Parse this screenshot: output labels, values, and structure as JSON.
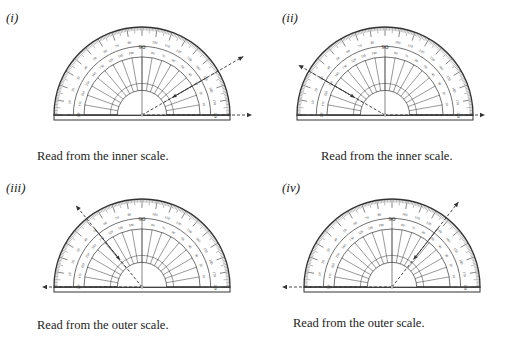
{
  "panels": [
    {
      "id": "i",
      "label": "(i)",
      "caption": "Read from the inner scale.",
      "label_pos": [
        6,
        10
      ],
      "caption_pos": [
        37,
        149
      ],
      "center": [
        142,
        115
      ],
      "radius": 88,
      "ray_angle_deg": 30,
      "ray_length": 117,
      "baseline_direction": "right",
      "baseline_extent": 110,
      "highlighted_scale": "inner"
    },
    {
      "id": "ii",
      "label": "(ii)",
      "caption": "Read from the inner scale.",
      "label_pos": [
        282,
        10
      ],
      "caption_pos": [
        321,
        149
      ],
      "center": [
        385,
        115
      ],
      "radius": 88,
      "ray_angle_deg": 150,
      "ray_length": 100,
      "baseline_direction": "right",
      "baseline_extent": 100,
      "highlighted_scale": "inner"
    },
    {
      "id": "iii",
      "label": "(iii)",
      "caption": "Read from the outer scale.",
      "label_pos": [
        6,
        180
      ],
      "caption_pos": [
        37,
        318
      ],
      "center": [
        142,
        287
      ],
      "radius": 88,
      "ray_angle_deg": 129,
      "ray_length": 105,
      "baseline_direction": "left",
      "baseline_extent": 100,
      "highlighted_scale": "outer"
    },
    {
      "id": "iv",
      "label": "(iv)",
      "caption": "Read from the outer scale.",
      "label_pos": [
        282,
        180
      ],
      "caption_pos": [
        293,
        316
      ],
      "center": [
        392,
        287
      ],
      "radius": 88,
      "ray_angle_deg": 52,
      "ray_length": 108,
      "baseline_direction": "left",
      "baseline_extent": 110,
      "highlighted_scale": "outer"
    }
  ],
  "scale": {
    "outer_labels": [
      0,
      10,
      20,
      30,
      40,
      50,
      60,
      70,
      80,
      90,
      100,
      110,
      120,
      130,
      140,
      150,
      160,
      170,
      180
    ],
    "inner_labels": [
      180,
      170,
      160,
      150,
      140,
      130,
      120,
      110,
      100,
      90,
      80,
      70,
      60,
      50,
      40,
      30,
      20,
      10,
      0
    ],
    "center_mark": "90"
  },
  "colors": {
    "ink": "#333333",
    "rule": "#555555",
    "background": "#ffffff"
  }
}
